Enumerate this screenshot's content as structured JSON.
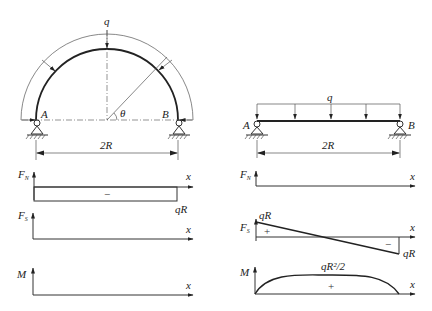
{
  "left_figure": {
    "structure": "semicircular-arch",
    "load_label": "q",
    "support_left_label": "A",
    "support_right_label": "B",
    "angle_label": "θ",
    "span_label": "2R"
  },
  "right_figure": {
    "structure": "simply-supported-beam",
    "load_label": "q",
    "support_left_label": "A",
    "support_right_label": "B",
    "span_label": "2R"
  },
  "diagrams": {
    "left": {
      "axial": {
        "y_label": "F",
        "y_sub": "N",
        "x_label": "x",
        "sign": "−",
        "value_label": "qR"
      },
      "shear": {
        "y_label": "F",
        "y_sub": "S",
        "x_label": "x"
      },
      "moment": {
        "y_label": "M",
        "x_label": "x"
      }
    },
    "right": {
      "axial": {
        "y_label": "F",
        "y_sub": "N",
        "x_label": "x"
      },
      "shear": {
        "y_label": "F",
        "y_sub": "S",
        "x_label": "x",
        "start_label": "qR",
        "end_label": "qR",
        "pos_sign": "+",
        "neg_sign": "−"
      },
      "moment": {
        "y_label": "M",
        "x_label": "x",
        "peak_label": "qR²/2",
        "sign": "+"
      }
    }
  },
  "colors": {
    "line": "#222222",
    "background": "#ffffff"
  }
}
